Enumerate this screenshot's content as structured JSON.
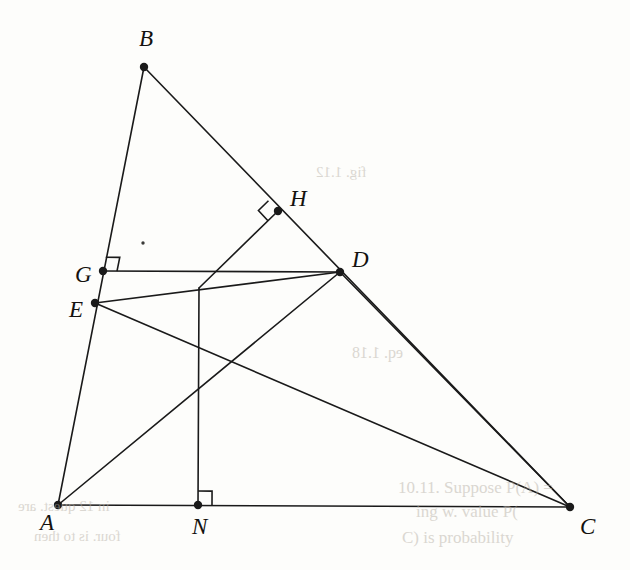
{
  "figure": {
    "width": 630,
    "height": 570,
    "background_color": "#fdfdfb",
    "ink_color": "#1a1a1a",
    "stroke_width": 1.6,
    "vertex_dot_radius": 4.2,
    "right_angle_size": 14,
    "points": [
      {
        "id": "A",
        "label": "A",
        "x": 58,
        "y": 505,
        "dot": true,
        "label_dx": -18,
        "label_dy": 18
      },
      {
        "id": "B",
        "label": "B",
        "x": 144,
        "y": 67,
        "dot": true,
        "label_dx": -5,
        "label_dy": -28
      },
      {
        "id": "C",
        "label": "C",
        "x": 570,
        "y": 507,
        "dot": true,
        "label_dx": 10,
        "label_dy": 20
      },
      {
        "id": "D",
        "label": "D",
        "x": 340,
        "y": 272,
        "dot": true,
        "label_dx": 12,
        "label_dy": -12
      },
      {
        "id": "E",
        "label": "E",
        "x": 95,
        "y": 303,
        "dot": true,
        "label_dx": -26,
        "label_dy": 7
      },
      {
        "id": "G",
        "label": "G",
        "x": 103,
        "y": 271,
        "dot": true,
        "label_dx": -28,
        "label_dy": 4
      },
      {
        "id": "H",
        "label": "H",
        "x": 278,
        "y": 211,
        "dot": true,
        "label_dx": 12,
        "label_dy": -12
      },
      {
        "id": "N",
        "label": "N",
        "x": 198,
        "y": 505,
        "dot": true,
        "label_dx": -6,
        "label_dy": 22
      },
      {
        "id": "M",
        "label": "",
        "x": 199,
        "y": 288,
        "dot": false,
        "label_dx": 0,
        "label_dy": 0
      }
    ],
    "segments": [
      {
        "name": "side-AB",
        "from": "A",
        "to": "B"
      },
      {
        "name": "side-BC",
        "from": "B",
        "to": "C"
      },
      {
        "name": "side-AC",
        "from": "A",
        "to": "C"
      },
      {
        "name": "cevian-AD",
        "from": "A",
        "to": "D"
      },
      {
        "name": "cevian-DC",
        "from": "D",
        "to": "C"
      },
      {
        "name": "segment-GD",
        "from": "G",
        "to": "D"
      },
      {
        "name": "segment-ED",
        "from": "E",
        "to": "D"
      },
      {
        "name": "segment-EC",
        "from": "E",
        "to": "C"
      },
      {
        "name": "segment-HM",
        "from": "H",
        "to": "M"
      },
      {
        "name": "segment-MN",
        "from": "M",
        "to": "N"
      }
    ],
    "right_angles": [
      {
        "name": "right-angle-at-G",
        "at": "G",
        "leg_a": "B",
        "leg_b": "D"
      },
      {
        "name": "right-angle-at-H",
        "at": "H",
        "leg_a": "B",
        "leg_b": "M"
      },
      {
        "name": "right-angle-at-N",
        "at": "N",
        "leg_a": "C",
        "leg_b": "M"
      }
    ],
    "stray_marks": [
      {
        "name": "stray-ink-speck",
        "x": 143,
        "y": 243,
        "r": 1.7
      }
    ],
    "bleed_through": [
      {
        "name": "bleed-line-1",
        "text": "10.11. Suppose  P(A) =",
        "x": 398,
        "y": 478,
        "size": 17,
        "flip": false
      },
      {
        "name": "bleed-line-2",
        "text": "ing w. value  P(",
        "x": 416,
        "y": 502,
        "size": 17,
        "flip": false
      },
      {
        "name": "bleed-line-3",
        "text": "C) is probability",
        "x": 402,
        "y": 528,
        "size": 17,
        "flip": false
      },
      {
        "name": "bleed-line-4",
        "text": "eq. 1.18",
        "x": 352,
        "y": 344,
        "size": 16,
        "flip": true
      },
      {
        "name": "bleed-line-5",
        "text": "in 12 quest. are",
        "x": 18,
        "y": 498,
        "size": 15,
        "flip": true
      },
      {
        "name": "bleed-line-6",
        "text": "four. is to then",
        "x": 34,
        "y": 528,
        "size": 15,
        "flip": true
      },
      {
        "name": "bleed-line-7",
        "text": "fig. 1.12",
        "x": 316,
        "y": 164,
        "size": 15,
        "flip": true
      }
    ]
  }
}
